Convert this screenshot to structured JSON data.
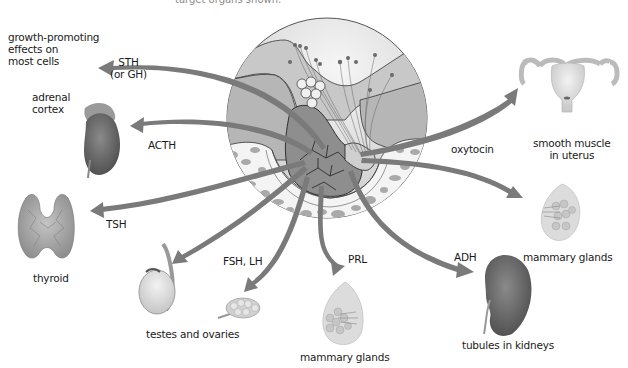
{
  "caption": "target organs shown.",
  "colors": {
    "arrow": "#7a7a7a",
    "circle_bg": "#e2e2e2",
    "tissue_mid": "#bdbdbd",
    "tissue_dark": "#8c8c8c",
    "bone_spot": "#a8a8a8",
    "organ_dark": "#5f5f5f",
    "organ_light": "#d6d6d6",
    "outline": "#2e2e2e"
  },
  "hormones": {
    "sth": "STH",
    "sth_alt": "(or GH)",
    "acth": "ACTH",
    "tsh": "TSH",
    "fsh_lh": "FSH, LH",
    "prl": "PRL",
    "adh": "ADH",
    "oxytocin": "oxytocin"
  },
  "targets": {
    "growth": [
      "growth-promoting",
      "effects on",
      "most cells"
    ],
    "adrenal": [
      "adrenal",
      "cortex"
    ],
    "thyroid": "thyroid",
    "gonads": "testes and ovaries",
    "mammary_bottom": "mammary glands",
    "kidney": "tubules in kidneys",
    "mammary_right": "mammary glands",
    "uterus": [
      "smooth muscle",
      "in uterus"
    ]
  }
}
